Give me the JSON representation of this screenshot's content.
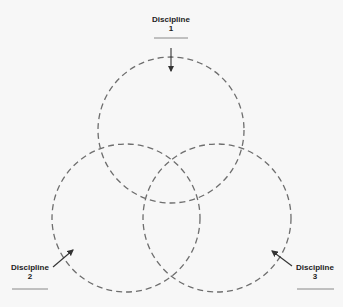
{
  "diagram": {
    "type": "venn",
    "title": "",
    "sets": [
      {
        "id": "d1",
        "label_line1": "Discipline",
        "label_line2": "1",
        "center": [
          171,
          130
        ],
        "radius": 73
      },
      {
        "id": "d2",
        "label_line1": "Discipline",
        "label_line2": "2",
        "center": [
          126,
          218
        ],
        "radius": 74
      },
      {
        "id": "d3",
        "label_line1": "Discipline",
        "label_line2": "3",
        "center": [
          217,
          218
        ],
        "radius": 74
      }
    ],
    "style": {
      "stroke": "#6e6e6e",
      "dash": "6 4",
      "arrow_color": "#333333",
      "underline_color": "#888888",
      "background": "#f7f7f7"
    }
  }
}
